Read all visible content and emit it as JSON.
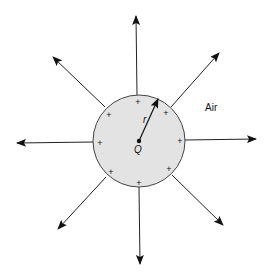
{
  "diagram": {
    "sphere": {
      "cx": 139,
      "cy": 141,
      "r": 46,
      "fill": "#e3e3e3",
      "stroke": "#444444"
    },
    "charge_label": "Q",
    "radius_label": "r",
    "medium_label": "Air",
    "plus_sign": "+",
    "plus_positions": [
      [
        138,
        102
      ],
      [
        109,
        115
      ],
      [
        166,
        113
      ],
      [
        100,
        143
      ],
      [
        180,
        141
      ],
      [
        111,
        172
      ],
      [
        169,
        169
      ],
      [
        139,
        183
      ]
    ],
    "field_lines": [
      {
        "name": "up",
        "x1": 137,
        "y1": 95,
        "x2": 136,
        "y2": 16
      },
      {
        "name": "up-right",
        "x1": 171,
        "y1": 107,
        "x2": 219,
        "y2": 53
      },
      {
        "name": "right",
        "x1": 185,
        "y1": 140,
        "x2": 256,
        "y2": 139
      },
      {
        "name": "down-right",
        "x1": 172,
        "y1": 175,
        "x2": 223,
        "y2": 225
      },
      {
        "name": "down",
        "x1": 139,
        "y1": 187,
        "x2": 140,
        "y2": 264
      },
      {
        "name": "down-left",
        "x1": 106,
        "y1": 177,
        "x2": 58,
        "y2": 229
      },
      {
        "name": "left",
        "x1": 93,
        "y1": 142,
        "x2": 17,
        "y2": 143
      },
      {
        "name": "up-left",
        "x1": 105,
        "y1": 107,
        "x2": 53,
        "y2": 57
      }
    ]
  }
}
